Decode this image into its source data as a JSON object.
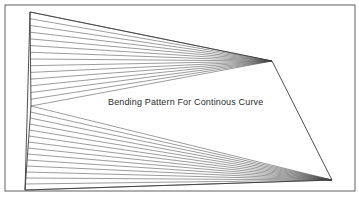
{
  "figure": {
    "caption": "Bending Pattern For Continous Curve",
    "title": "Bending Pattern For Continous Curve",
    "type": "technical-line-drawing",
    "canvas": {
      "width": 359,
      "height": 201,
      "background": "#ffffff"
    },
    "colors": {
      "stroke": "#4a4a4a",
      "outline": "#3c3c3c",
      "frame": "#6e6e6e",
      "text": "#2b2b2b",
      "background": "#ffffff"
    },
    "frame": {
      "label": "page-frame",
      "x": 5,
      "y": 5,
      "width": 350,
      "height": 186,
      "stroke_width": 1.1
    },
    "outline": {
      "label": "bending-pattern-outline",
      "points": "30,12 272,61 332,180 25,190",
      "stroke_width": 0.9
    },
    "vertices": {
      "top_left": {
        "x": 30,
        "y": 12,
        "label": "top-left-vertex"
      },
      "right_upper_apex": {
        "x": 272,
        "y": 61,
        "label": "upper-convergence-apex"
      },
      "right_lower_apex": {
        "x": 332,
        "y": 180,
        "label": "lower-convergence-apex"
      },
      "bottom_left": {
        "x": 25,
        "y": 190,
        "label": "bottom-left-vertex"
      },
      "left_mid": {
        "x": 31,
        "y": 106,
        "label": "left-middle-vertex"
      }
    },
    "left_edge": {
      "label": "left-spine",
      "points": "30,12 31,106 25,190",
      "stroke_width": 0.9
    },
    "upper_fan": {
      "label": "upper-fan",
      "apex": {
        "x": 272,
        "y": 61
      },
      "line_count": 14,
      "start_x": 30,
      "start_y": 12,
      "end_x": 31,
      "end_y": 106
    },
    "lower_fan": {
      "label": "lower-fan",
      "apex": {
        "x": 332,
        "y": 180
      },
      "line_count": 14,
      "start_x": 31,
      "start_y": 106,
      "end_x": 25,
      "end_y": 190
    }
  }
}
